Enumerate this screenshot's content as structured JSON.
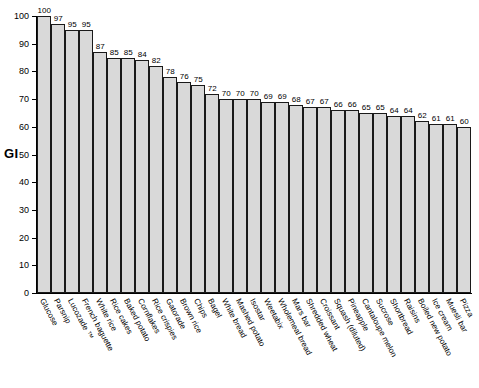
{
  "chart_data": {
    "type": "bar",
    "title": "",
    "xlabel": "",
    "ylabel": "GI",
    "ylim": [
      0,
      100
    ],
    "yticks": [
      0,
      10,
      20,
      30,
      40,
      50,
      60,
      70,
      80,
      90,
      100
    ],
    "grid": false,
    "legend": null,
    "bar_color": "#d9d9d9",
    "bar_edge_color": "#1a1a1a",
    "show_value_labels": true,
    "categories": [
      "Glucose",
      "Parsnip",
      "Lucozade ™",
      "French baguette",
      "White rice",
      "Rice cakes",
      "Baked potato",
      "Cornflakes",
      "Rice crispies",
      "Gatorade",
      "Brown rice",
      "Chips",
      "Bagel",
      "White bread",
      "Mashed potato",
      "Isostar",
      "Weetabix",
      "Wholemeal bread",
      "Mars bar",
      "Shredded wheat",
      "Croissant",
      "Squash (diluted)",
      "Pineapple",
      "Cantaloupe melon",
      "Sucrose",
      "Shortbread",
      "Raisins",
      "Boiled new potato",
      "Ice cream",
      "Muesli bar",
      "Pizza"
    ],
    "values": [
      100,
      97,
      95,
      95,
      87,
      85,
      85,
      84,
      82,
      78,
      76,
      75,
      72,
      70,
      70,
      70,
      69,
      69,
      68,
      67,
      67,
      66,
      66,
      65,
      65,
      64,
      64,
      62,
      61,
      61,
      60
    ]
  }
}
